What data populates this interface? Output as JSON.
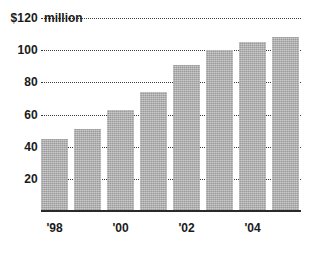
{
  "chart_data": {
    "type": "bar",
    "title": "",
    "subtitle": "",
    "xlabel": "",
    "ylabel": "",
    "unit_label": "$120 million",
    "y_axis": {
      "ticks": [
        {
          "label": "$120",
          "value": 120
        },
        {
          "label": "100",
          "value": 100
        },
        {
          "label": "80",
          "value": 80
        },
        {
          "label": "60",
          "value": 60
        },
        {
          "label": "40",
          "value": 40
        },
        {
          "label": "20",
          "value": 20
        }
      ],
      "ylim": [
        0,
        120
      ],
      "grid": true
    },
    "x_axis": {
      "tick_labels": [
        "'98",
        "'00",
        "'02",
        "'04"
      ],
      "grid": false
    },
    "categories": [
      "'98",
      "'99",
      "'00",
      "'01",
      "'02",
      "'03",
      "'04",
      "'05"
    ],
    "values": [
      45,
      51,
      63,
      74,
      91,
      100,
      105,
      108
    ],
    "series": [
      {
        "name": "Revenue",
        "values": [
          45,
          51,
          63,
          74,
          91,
          100,
          105,
          108
        ]
      }
    ],
    "legend": [],
    "annotations": [],
    "colors": {
      "bar_fill": "#9a9a9a",
      "grid": "#3a3a3a",
      "axis": "#2a2a2a",
      "text": "#1a1a1a",
      "background": "#ffffff"
    }
  }
}
